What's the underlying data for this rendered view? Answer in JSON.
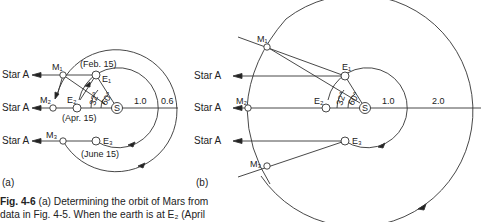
{
  "figure": {
    "panel_a": {
      "label": "(a)",
      "star_label": "Star A",
      "earth_points": [
        "E₁",
        "E₂",
        "E₃"
      ],
      "mars_points": [
        "M₁",
        "M₂",
        "M₃"
      ],
      "dates": [
        "(Feb. 15)",
        "(Apr. 15)",
        "(June 15)"
      ],
      "sun": "S",
      "angles": [
        "32°",
        "60°"
      ],
      "distances": [
        "1.0",
        "0.6"
      ]
    },
    "panel_b": {
      "label": "(b)",
      "star_label": "Star A",
      "earth_points": [
        "E₁",
        "E₂",
        "E₃"
      ],
      "mars_points": [
        "M₁",
        "M₂",
        "M₃"
      ],
      "sun": "S",
      "angles": [
        "32°",
        "60°"
      ],
      "distances": [
        "1.0",
        "2.0"
      ]
    },
    "caption": {
      "number": "Fig. 4-6",
      "line1": " (a) Determining the orbit of Mars from",
      "line2": "data in Fig. 4-5. When the earth is at E₂ (April"
    }
  }
}
